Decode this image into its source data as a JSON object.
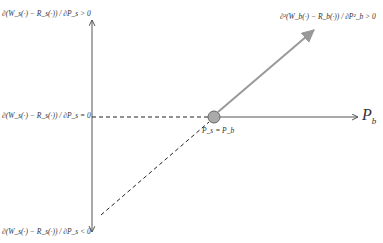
{
  "diagram": {
    "labels": {
      "top_left": "∂(W_s(·) − R_s(·)) / ∂P_s > 0",
      "mid_left": "∂(W_s(·) − R_s(·)) / ∂P_s = 0",
      "bottom_left": "∂(W_s(·) − R_s(·)) / ∂P_s < 0",
      "top_right": "∂²(W_b(·) − R_b(·)) / ∂P²_b > 0",
      "intersection": "P_s = P_b",
      "x_axis_main": "P",
      "x_axis_sub": "b"
    },
    "colors": {
      "axis": "#555555",
      "gray_arrow": "#999999",
      "dashed": "#222222",
      "node_fill": "#aaaaaa",
      "node_stroke": "#666666"
    }
  }
}
